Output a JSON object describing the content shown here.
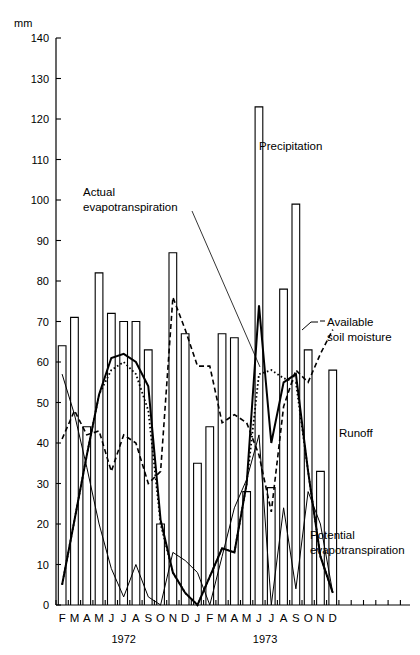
{
  "chart_data": {
    "type": "line",
    "title": "",
    "ylabel": "mm",
    "xlabel": "",
    "ylim": [
      0,
      140
    ],
    "y_ticks": [
      0,
      10,
      20,
      30,
      40,
      50,
      60,
      70,
      80,
      90,
      100,
      110,
      120,
      130,
      140
    ],
    "grid": false,
    "legend_position": "inline-annotations",
    "x_categories": [
      "F",
      "M",
      "A",
      "M",
      "J",
      "J",
      "A",
      "S",
      "O",
      "N",
      "D",
      "J",
      "F",
      "M",
      "A",
      "M",
      "J",
      "J",
      "A",
      "S",
      "O",
      "N",
      "D"
    ],
    "x_groups": [
      {
        "label": "1972",
        "start_index": 0,
        "end_index": 10
      },
      {
        "label": "1973",
        "start_index": 11,
        "end_index": 22
      }
    ],
    "annotations": [
      {
        "name": "precipitation",
        "text": "Precipitation"
      },
      {
        "name": "actual-evapotranspiration",
        "text": "Actual\nevapotranspiration",
        "line1": "Actual",
        "line2": "evapotranspiration"
      },
      {
        "name": "available-soil-moisture",
        "text": "Available\nsoil moisture",
        "line1": "Available",
        "line2": "soil moisture"
      },
      {
        "name": "runoff",
        "text": "Runoff"
      },
      {
        "name": "potential-evapotranspiration",
        "text": "Potential\nevapotranspiration",
        "line1": "Potential",
        "line2": "evapotranspiration"
      }
    ],
    "series": [
      {
        "name": "Precipitation",
        "style": "bar-outline",
        "values": [
          64,
          71,
          44,
          82,
          72,
          70,
          70,
          63,
          20,
          87,
          67,
          35,
          44,
          67,
          66,
          28,
          123,
          29,
          78,
          99,
          63,
          33,
          58
        ]
      },
      {
        "name": "Potential evapotranspiration",
        "style": "solid",
        "values": [
          5,
          21,
          37,
          52,
          61,
          62,
          60,
          54,
          21,
          8,
          3,
          0,
          7,
          14,
          13,
          30,
          74,
          40,
          55,
          57,
          33,
          12,
          3
        ]
      },
      {
        "name": "Actual evapotranspiration",
        "style": "dotted",
        "values": [
          5,
          21,
          37,
          52,
          58,
          60,
          57,
          48,
          20,
          8,
          3,
          0,
          7,
          14,
          13,
          30,
          57,
          58,
          56,
          55,
          33,
          12,
          3
        ]
      },
      {
        "name": "Available soil moisture",
        "style": "dashed",
        "values": [
          41,
          48,
          42,
          43,
          33,
          42,
          40,
          30,
          33,
          76,
          68,
          59,
          59,
          45,
          47,
          45,
          37,
          23,
          49,
          58,
          55,
          62,
          68
        ]
      },
      {
        "name": "Runoff",
        "style": "solid-thin",
        "values": [
          57,
          47,
          34,
          20,
          9,
          2,
          10,
          2,
          0,
          13,
          11,
          8,
          0,
          12,
          24,
          31,
          42,
          0,
          24,
          4,
          28,
          20,
          3
        ]
      }
    ]
  },
  "axis": {
    "unit_label": "mm"
  }
}
